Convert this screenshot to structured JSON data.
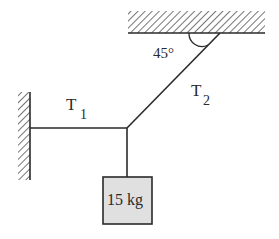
{
  "diagram": {
    "angle_label": "45°",
    "t1": {
      "main": "T",
      "sub": "1"
    },
    "t2": {
      "main": "T",
      "sub": "2"
    },
    "mass_label": "15 kg",
    "colors": {
      "line": "#2a2a2a",
      "box_fill": "#e0e0e0",
      "hatch": "#3a3a3a"
    }
  }
}
